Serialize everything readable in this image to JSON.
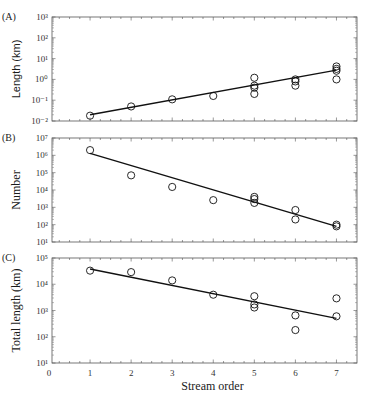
{
  "chart_data": [
    {
      "panel": "(A)",
      "type": "scatter",
      "ylabel": "Length (km)",
      "xlabel": "",
      "yscale": "log",
      "ylim": [
        0.01,
        1000
      ],
      "yticks": [
        "10^-2",
        "10^-1",
        "10^0",
        "10^1",
        "10^2",
        "10^3"
      ],
      "xlim": [
        0,
        7.5
      ],
      "points": [
        {
          "x": 1,
          "y": 0.018
        },
        {
          "x": 2,
          "y": 0.05
        },
        {
          "x": 3,
          "y": 0.11
        },
        {
          "x": 4,
          "y": 0.16
        },
        {
          "x": 5,
          "y": 1.2
        },
        {
          "x": 5,
          "y": 0.5
        },
        {
          "x": 5,
          "y": 0.4
        },
        {
          "x": 5,
          "y": 0.2
        },
        {
          "x": 6,
          "y": 1.0
        },
        {
          "x": 6,
          "y": 0.8
        },
        {
          "x": 6,
          "y": 0.5
        },
        {
          "x": 7,
          "y": 4.2
        },
        {
          "x": 7,
          "y": 3.2
        },
        {
          "x": 7,
          "y": 2.6
        },
        {
          "x": 7,
          "y": 1.0
        }
      ],
      "fit_line": [
        {
          "x": 1,
          "y": 0.02
        },
        {
          "x": 7,
          "y": 2.8
        }
      ]
    },
    {
      "panel": "(B)",
      "type": "scatter",
      "ylabel": "Number",
      "xlabel": "",
      "yscale": "log",
      "ylim": [
        10,
        10000000
      ],
      "yticks": [
        "10^1",
        "10^2",
        "10^3",
        "10^4",
        "10^5",
        "10^6",
        "10^7"
      ],
      "xlim": [
        0,
        7.5
      ],
      "points": [
        {
          "x": 1,
          "y": 2000000
        },
        {
          "x": 2,
          "y": 70000
        },
        {
          "x": 3,
          "y": 15000
        },
        {
          "x": 4,
          "y": 2600
        },
        {
          "x": 5,
          "y": 4000
        },
        {
          "x": 5,
          "y": 3000
        },
        {
          "x": 5,
          "y": 1800
        },
        {
          "x": 6,
          "y": 700
        },
        {
          "x": 6,
          "y": 200
        },
        {
          "x": 7,
          "y": 100
        },
        {
          "x": 7,
          "y": 80
        }
      ],
      "fit_line": [
        {
          "x": 1,
          "y": 1300000
        },
        {
          "x": 7,
          "y": 80
        }
      ]
    },
    {
      "panel": "(C)",
      "type": "scatter",
      "ylabel": "Total length (km)",
      "xlabel": "Stream order",
      "yscale": "log",
      "ylim": [
        10,
        100000
      ],
      "yticks": [
        "10^1",
        "10^2",
        "10^3",
        "10^4",
        "10^5"
      ],
      "xlim": [
        0,
        7.5
      ],
      "xticks": [
        "0",
        "1",
        "2",
        "3",
        "4",
        "5",
        "6",
        "7"
      ],
      "points": [
        {
          "x": 1,
          "y": 33000
        },
        {
          "x": 2,
          "y": 29000
        },
        {
          "x": 3,
          "y": 14000
        },
        {
          "x": 4,
          "y": 4000
        },
        {
          "x": 5,
          "y": 3500
        },
        {
          "x": 5,
          "y": 1700
        },
        {
          "x": 5,
          "y": 1300
        },
        {
          "x": 6,
          "y": 650
        },
        {
          "x": 6,
          "y": 180
        },
        {
          "x": 7,
          "y": 2900
        },
        {
          "x": 7,
          "y": 600
        }
      ],
      "fit_line": [
        {
          "x": 1,
          "y": 38000
        },
        {
          "x": 7,
          "y": 500
        }
      ]
    }
  ],
  "labels": {
    "panelA": "(A)",
    "panelB": "(B)",
    "panelC": "(C)",
    "ylabelA": "Length (km)",
    "ylabelB": "Number",
    "ylabelC": "Total length (km)",
    "xlabel": "Stream order",
    "xticks": [
      "0",
      "1",
      "2",
      "3",
      "4",
      "5",
      "6",
      "7"
    ]
  }
}
